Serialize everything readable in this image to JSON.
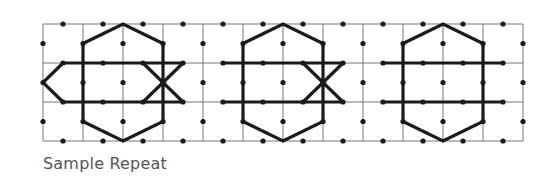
{
  "caption": "Sample Repeat",
  "colors": {
    "grid": "#777777",
    "pattern": "#1a1a1a",
    "dot": "#1a1a1a",
    "caption": "#555555"
  },
  "grid": {
    "x0": 43,
    "y0": 24,
    "cols": 12,
    "rows": 3,
    "cell_w": 40,
    "cell_h": 39
  },
  "motifs": {
    "star_centers_col": [
      2,
      6,
      10
    ],
    "diamond_centers_col": [
      4,
      8,
      12
    ]
  }
}
